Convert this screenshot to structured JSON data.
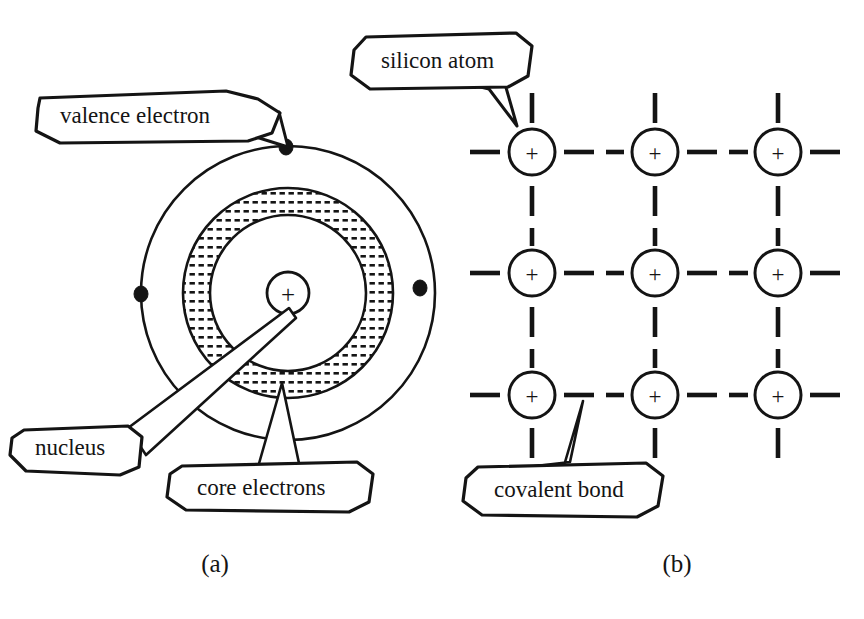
{
  "figure": {
    "panels": [
      {
        "id": "panel-a",
        "caption": "(a)",
        "caption_x": 215,
        "caption_y": 566,
        "description": "Bohr-style silicon atom with nucleus, core electron shell band and valence shell",
        "atom": {
          "center_x": 288,
          "center_y": 293,
          "nucleus_symbol": "+",
          "nucleus_radius": 21,
          "valence_shell_radius": 147,
          "core_band_outer_radius": 105,
          "core_band_inner_radius": 78,
          "core_inner_circle_radius": 78,
          "valence_electrons": [
            {
              "x": 286,
              "y": 147
            },
            {
              "x": 141,
              "y": 294
            },
            {
              "x": 420,
              "y": 288
            },
            {
              "x": 283,
              "y": 435
            }
          ]
        },
        "labels": [
          {
            "id": "valence-electron",
            "text": "valence electron",
            "text_x": 60,
            "text_y": 118,
            "box": "40,98 225,92 258,100 278,112 276,131 250,140 60,142 36,130 38,108",
            "tail": "258,100 278,112 286,147 249,125"
          },
          {
            "id": "nucleus",
            "text": "nucleus",
            "text_x": 35,
            "text_y": 449,
            "box": "22,430 126,427 140,436 138,466 120,474 24,470 10,454 12,438",
            "tail": "126,427 140,436 288,310 147,452"
          },
          {
            "id": "core-electrons",
            "text": "core electrons",
            "text_x": 197,
            "text_y": 489,
            "box": "182,466 356,463 372,474 368,501 350,511 186,509 168,496 170,474",
            "tail": "262,466 296,466 282,384 248,464"
          }
        ]
      },
      {
        "id": "panel-b",
        "caption": "(b)",
        "caption_x": 677,
        "caption_y": 566,
        "description": "Two-dimensional silicon crystal lattice with covalent bonds",
        "lattice": {
          "atom_symbol": "+",
          "circle_radius": 23,
          "columns_x": [
            532,
            655,
            778
          ],
          "rows_y": [
            152,
            273,
            395
          ],
          "bond_style": "dashed"
        },
        "labels": [
          {
            "id": "silicon-atom",
            "text": "silicon atom",
            "text_x": 381,
            "text_y": 63,
            "box": "366,38 515,34 531,46 528,76 508,86 370,88 352,74 354,50"
          },
          {
            "id": "covalent-bond",
            "text": "covalent bond",
            "text_x": 494,
            "text_y": 492,
            "box": "478,468 645,464 662,476 658,506 638,516 482,514 464,500 466,478"
          }
        ]
      }
    ]
  },
  "colors": {
    "ink": "#141414",
    "background": "#ffffff"
  }
}
